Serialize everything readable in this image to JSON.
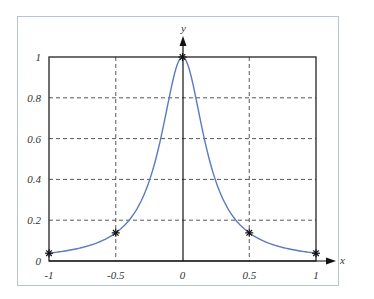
{
  "chart_data": {
    "type": "line",
    "title": "",
    "xlabel": "x",
    "ylabel": "y",
    "xlim": [
      -1,
      1
    ],
    "ylim": [
      0,
      1
    ],
    "grid": true,
    "x_ticks": [
      "-1",
      "-0.5",
      "0",
      "0.5",
      "1"
    ],
    "y_ticks": [
      "0",
      "0.2",
      "0.4",
      "0.6",
      "0.8",
      "1"
    ],
    "series": [
      {
        "name": "f(x) = 1/(1+25x^2)",
        "color": "#5a7bbf",
        "x": [
          -1,
          -0.9,
          -0.8,
          -0.7,
          -0.6,
          -0.5,
          -0.4,
          -0.3,
          -0.2,
          -0.1,
          0,
          0.1,
          0.2,
          0.3,
          0.4,
          0.5,
          0.6,
          0.7,
          0.8,
          0.9,
          1
        ],
        "values": [
          0.038,
          0.047,
          0.059,
          0.075,
          0.1,
          0.138,
          0.2,
          0.308,
          0.5,
          0.8,
          1.0,
          0.8,
          0.5,
          0.308,
          0.2,
          0.138,
          0.1,
          0.075,
          0.059,
          0.047,
          0.038
        ]
      },
      {
        "name": "nodes",
        "marker": "asterisk",
        "x": [
          -1,
          -0.5,
          0,
          0.5,
          1
        ],
        "values": [
          0.038,
          0.138,
          1.0,
          0.138,
          0.038
        ]
      }
    ]
  },
  "labels": {
    "x_axis": "x",
    "y_axis": "y",
    "x_ticks": [
      "-1",
      "-0.5",
      "0",
      "0.5",
      "1"
    ],
    "y_ticks": [
      "0",
      "0.2",
      "0.4",
      "0.6",
      "0.8",
      "1"
    ]
  }
}
